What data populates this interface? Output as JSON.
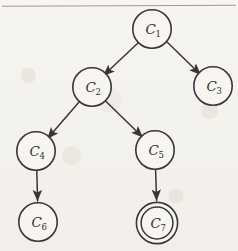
{
  "figure": {
    "width": 238,
    "height": 251,
    "background_color": "#f4f2ee",
    "stroke_color": "#3a3633",
    "rule_color": "#8c8880"
  },
  "graph": {
    "type": "directed-tree",
    "node_radius": 19,
    "accepting_inner_radius": 15,
    "nodes": [
      {
        "id": "C1",
        "label": "C",
        "sub": "1",
        "cx": 152,
        "cy": 29,
        "shape": "circle",
        "accepting": false
      },
      {
        "id": "C2",
        "label": "C",
        "sub": "2",
        "cx": 92,
        "cy": 87,
        "shape": "circle",
        "accepting": false
      },
      {
        "id": "C3",
        "label": "C",
        "sub": "3",
        "cx": 213,
        "cy": 86,
        "shape": "circle",
        "accepting": false
      },
      {
        "id": "C4",
        "label": "C",
        "sub": "4",
        "cx": 36,
        "cy": 151,
        "shape": "circle",
        "accepting": false
      },
      {
        "id": "C5",
        "label": "C",
        "sub": "5",
        "cx": 155,
        "cy": 150,
        "shape": "circle",
        "accepting": false
      },
      {
        "id": "C6",
        "label": "C",
        "sub": "6",
        "cx": 38,
        "cy": 222,
        "shape": "circle",
        "accepting": false
      },
      {
        "id": "C7",
        "label": "C",
        "sub": "7",
        "cx": 157,
        "cy": 223,
        "shape": "double-circle",
        "accepting": true
      }
    ],
    "edges": [
      {
        "from": "C1",
        "to": "C2",
        "style": "diagonal",
        "arrow": true
      },
      {
        "from": "C1",
        "to": "C3",
        "style": "diagonal",
        "arrow": true
      },
      {
        "from": "C2",
        "to": "C4",
        "style": "diagonal",
        "arrow": true
      },
      {
        "from": "C2",
        "to": "C5",
        "style": "diagonal",
        "arrow": true
      },
      {
        "from": "C4",
        "to": "C6",
        "style": "vertical",
        "arrow": true
      },
      {
        "from": "C5",
        "to": "C7",
        "style": "vertical",
        "arrow": true
      }
    ]
  },
  "artifacts": {
    "top_rule": {
      "x1": 2,
      "y1": 6,
      "x2": 236,
      "y2": 5
    }
  }
}
